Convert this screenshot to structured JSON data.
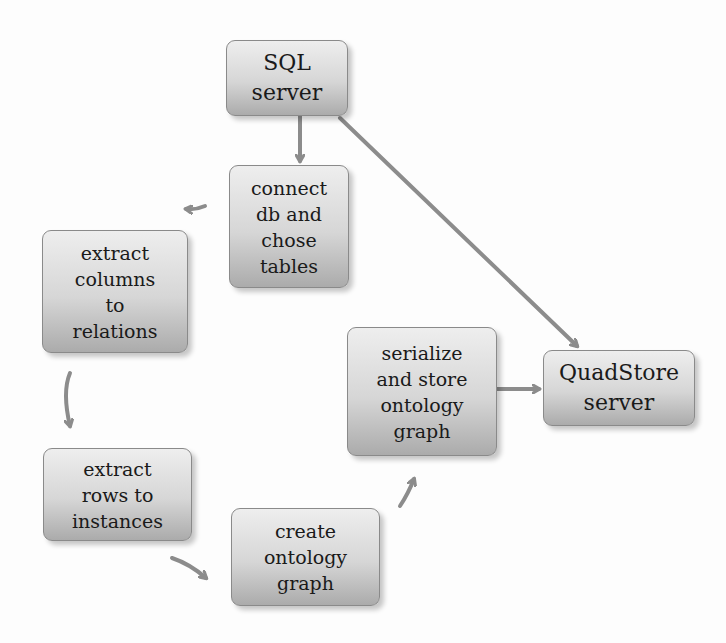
{
  "diagram": {
    "type": "flowchart",
    "colors": {
      "edge": "#8c8c8c",
      "node_border": "#8a8a8a",
      "node_top": "#eeeeee",
      "node_bottom": "#ababab"
    },
    "nodes": [
      {
        "id": "sql",
        "label": "SQL server"
      },
      {
        "id": "connect",
        "label": "connect\ndb and\nchose\ntables"
      },
      {
        "id": "columns",
        "label": "extract\ncolumns\nto\nrelations"
      },
      {
        "id": "rows",
        "label": "extract\nrows to\ninstances"
      },
      {
        "id": "create",
        "label": "create\nontology\ngraph"
      },
      {
        "id": "serialize",
        "label": "serialize\nand store\nontology\ngraph"
      },
      {
        "id": "quad",
        "label": "QuadStore\nserver"
      }
    ],
    "edges": [
      {
        "from": "sql",
        "to": "connect"
      },
      {
        "from": "sql",
        "to": "quad"
      },
      {
        "from": "connect",
        "to": "columns"
      },
      {
        "from": "columns",
        "to": "rows"
      },
      {
        "from": "rows",
        "to": "create"
      },
      {
        "from": "create",
        "to": "serialize"
      },
      {
        "from": "serialize",
        "to": "quad"
      }
    ]
  }
}
